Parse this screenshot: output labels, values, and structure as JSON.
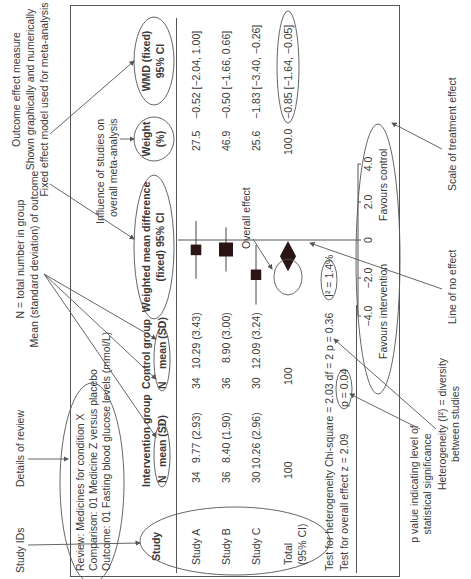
{
  "annotations": {
    "study_ids": "Study IDs",
    "details_of_review": "Details of review",
    "n_note": "N = total number in group",
    "mean_note": "Mean (standard deviation) of outcome",
    "outcome_measure_1": "Outcome effect measure",
    "outcome_measure_2": "Shown graphically and numerically",
    "outcome_measure_3": "Fixed effect model used for meta-analysis",
    "influence_1": "Influence of studies on",
    "influence_2": "overall meta-analysis",
    "overall_effect": "Overall effect",
    "line_of_no_effect": "Line of no effect",
    "scale_of_effect": "Scale of treatment effect",
    "p_value_1": "p value indicating level of",
    "p_value_2": "statistical significance",
    "heterogeneity_1": "Heterogeneity (I²) = diversity",
    "heterogeneity_2": "between studies"
  },
  "review": {
    "review": "Review: Medicines for condition X",
    "comparison": "Comparison: 01 Medicine Z versus placebo",
    "outcome": "Outcome: 01 Fasting blood glucose levels (mmol/L)"
  },
  "headers": {
    "study": "Study",
    "intervention": "Intervention group",
    "control": "Control group",
    "n": "N",
    "mean_sd": "mean (SD)",
    "wmd_1": "Weighted mean difference",
    "wmd_2": "(fixed) 95% CI",
    "weight_1": "Weight",
    "weight_2": "(%)",
    "wmdf_1": "WMD (fixed)",
    "wmdf_2": "95% CI"
  },
  "rows": [
    {
      "study": "Study A",
      "int_n": "34",
      "int_mean": "9.77 (2.93)",
      "ctl_n": "34",
      "ctl_mean": "10.29 (3.43)",
      "weight": "27.5",
      "wmd": "−0.52 [−2.04, 1.00]"
    },
    {
      "study": "Study B",
      "int_n": "36",
      "int_mean": "8.40 (1.90)",
      "ctl_n": "36",
      "ctl_mean": "8.90 (3.00)",
      "weight": "46.9",
      "wmd": "−0.50 [−1.66, 0.66]"
    },
    {
      "study": "Study C",
      "int_n": "30",
      "int_mean": "10.26 (2.96)",
      "ctl_n": "30",
      "ctl_mean": "12.09 (3.24)",
      "weight": "25.6",
      "wmd": "−1.83 [−3.40, −0.26]"
    }
  ],
  "total": {
    "label_1": "Total",
    "label_2": "(95% CI)",
    "int_n": "100",
    "ctl_n": "100",
    "weight": "100.0",
    "wmd": "−0.85 [−1.64, −0.05]"
  },
  "tests": {
    "heterogeneity": "Test for heterogeneity Chi-square = 2.03 df = 2 p = 0.36",
    "i2": "I² = 1.4%",
    "overall": "Test for overall effect z = 2.09",
    "p": "p = 0.04"
  },
  "axis": {
    "ticks": [
      "−4.0",
      "−2.0",
      "0",
      "2.0",
      "4.0"
    ],
    "favours_left": "Favours intervention",
    "favours_right": "Favours control"
  },
  "chart_data": {
    "type": "forest",
    "x_range": [
      -4,
      4
    ],
    "ticks": [
      -4,
      -2,
      0,
      2,
      4
    ],
    "studies": [
      {
        "name": "Study A",
        "estimate": -0.52,
        "ci": [
          -2.04,
          1.0
        ],
        "weight": 27.5
      },
      {
        "name": "Study B",
        "estimate": -0.5,
        "ci": [
          -1.66,
          0.66
        ],
        "weight": 46.9
      },
      {
        "name": "Study C",
        "estimate": -1.83,
        "ci": [
          -3.4,
          -0.26
        ],
        "weight": 25.6
      }
    ],
    "overall": {
      "estimate": -0.85,
      "ci": [
        -1.64,
        -0.05
      ]
    }
  }
}
